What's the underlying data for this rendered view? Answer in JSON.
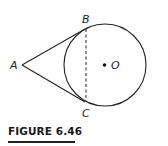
{
  "figure": {
    "caption": "FIGURE 6.46",
    "points": {
      "A": {
        "label": "A"
      },
      "B": {
        "label": "B"
      },
      "C": {
        "label": "C"
      },
      "O": {
        "label": "O"
      }
    },
    "elements": [
      "circle centered at O",
      "tangent segment AB",
      "tangent segment AC",
      "dashed chord BC",
      "center point O"
    ]
  }
}
